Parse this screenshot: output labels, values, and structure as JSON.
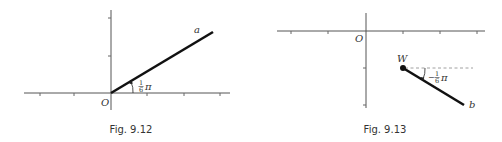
{
  "figures": [
    {
      "caption": "Fig. 9.12",
      "origin_label": "O",
      "vector_label": "a",
      "angle_label": {
        "numerator": "1",
        "denominator": "6",
        "symbol": "π",
        "sign": ""
      },
      "angle": "1/6 π"
    },
    {
      "caption": "Fig. 9.13",
      "origin_label": "O",
      "point_label": "W",
      "vector_label": "b",
      "angle_label": {
        "numerator": "1",
        "denominator": "6",
        "symbol": "π",
        "sign": "−"
      },
      "angle": "−1/6 π"
    }
  ],
  "colors": {
    "axis": "#555555",
    "vector": "#111111",
    "text": "#333333",
    "background": "#ffffff"
  }
}
